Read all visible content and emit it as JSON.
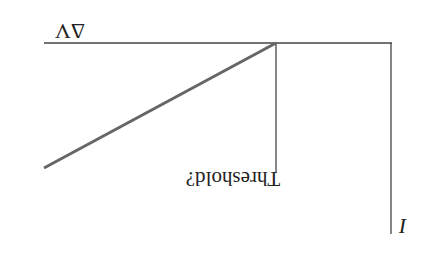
{
  "diagram": {
    "orientation": "rotated 180 degrees",
    "x_axis_label": "ΔV",
    "y_axis_label": "I",
    "threshold_label": "Threshold?",
    "colors": {
      "axis": "#333333",
      "curve": "#666666",
      "text": "#222222",
      "background": "#ffffff"
    }
  }
}
